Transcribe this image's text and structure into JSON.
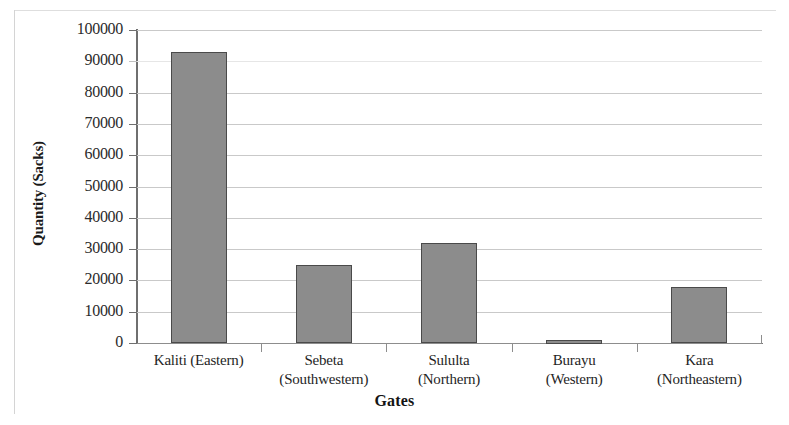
{
  "chart_data": {
    "type": "bar",
    "title": "",
    "xlabel": "Gates",
    "ylabel": "Quantity (Sacks)",
    "categories": [
      "Kaliti (Eastern)",
      "Sebeta (Southwestern)",
      "Sululta (Northern)",
      "Burayu (Western)",
      "Kara (Northeastern)"
    ],
    "category_lines": [
      {
        "line1": "Kaliti (Eastern)",
        "line2": ""
      },
      {
        "line1": "Sebeta",
        "line2": "(Southwestern)"
      },
      {
        "line1": "Sululta",
        "line2": "(Northern)"
      },
      {
        "line1": "Burayu",
        "line2": "(Western)"
      },
      {
        "line1": "Kara",
        "line2": "(Northeastern)"
      }
    ],
    "values": [
      93000,
      25000,
      32000,
      1000,
      18000
    ],
    "ylim": [
      0,
      100000
    ],
    "ytick_step": 10000,
    "ytick_labels": [
      "100000",
      "90000",
      "80000",
      "70000",
      "60000",
      "50000",
      "40000",
      "30000",
      "20000",
      "10000",
      "0"
    ],
    "grid": true,
    "legend": "none",
    "bar_color": "#8c8c8c",
    "bar_border_color": "#4a4a4a",
    "gridline_color": "#c9c9c9",
    "axis_color": "#6f6f6f"
  }
}
